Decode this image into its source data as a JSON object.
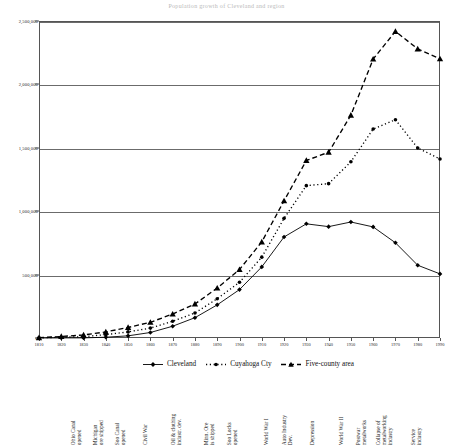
{
  "figure": {
    "title_sliver": "Population growth of Cleveland and region",
    "axis_color": "#555555",
    "grid_color": "#6b6b6b",
    "series_color": "#000000"
  },
  "chart_data": {
    "type": "line",
    "title": "Population growth of Cleveland and region",
    "xlabel": "",
    "ylabel": "",
    "xlim": [
      1810,
      1990
    ],
    "ylim": [
      0,
      2500000
    ],
    "grid": true,
    "legend_position": "bottom",
    "x": [
      1810,
      1820,
      1830,
      1840,
      1850,
      1860,
      1870,
      1880,
      1890,
      1900,
      1910,
      1920,
      1930,
      1940,
      1950,
      1960,
      1970,
      1980,
      1990
    ],
    "xticklabels": [
      "1810",
      "1820",
      "1830",
      "1840",
      "1850",
      "1860",
      "1870",
      "1880",
      "1890",
      "1900",
      "1910",
      "1920",
      "1930",
      "1940",
      "1950",
      "1960",
      "1970",
      "1980",
      "1990"
    ],
    "yticks": [
      0,
      500000,
      1000000,
      1500000,
      2000000,
      2500000
    ],
    "yticklabels": [
      "0",
      "500,000",
      "1,000,000",
      "1,500,000",
      "2,000,000",
      "2,500,000"
    ],
    "series": [
      {
        "name": "Cleveland",
        "marker": "diamond",
        "linestyle": "solid",
        "values": [
          57,
          606,
          1075,
          6071,
          17034,
          43417,
          92829,
          160146,
          261353,
          381768,
          560663,
          796841,
          900429,
          878336,
          914808,
          876050,
          750903,
          573822,
          505616
        ]
      },
      {
        "name": "Cuyahoga Cty",
        "marker": "circle",
        "linestyle": "dotted",
        "values": [
          1459,
          6328,
          10373,
          26506,
          48099,
          78033,
          132010,
          196943,
          309970,
          439120,
          637425,
          943495,
          1201455,
          1217250,
          1389532,
          1647895,
          1721300,
          1498400,
          1412140
        ]
      },
      {
        "name": "Five-county area",
        "marker": "triangle",
        "linestyle": "dashed",
        "values": [
          2500,
          12000,
          24000,
          48000,
          83000,
          124000,
          189000,
          268000,
          394000,
          540000,
          758000,
          1082000,
          1400000,
          1465000,
          1757000,
          2200000,
          2418000,
          2280000,
          2202000
        ]
      }
    ],
    "annotations": [
      {
        "year": 1830,
        "label_lines": [
          "Ohio Canal",
          "opened"
        ]
      },
      {
        "year": 1840,
        "label_lines": [
          "Michigan",
          "ore shipped"
        ]
      },
      {
        "year": 1850,
        "label_lines": [
          "Soo Canal",
          "opened"
        ]
      },
      {
        "year": 1860,
        "label_lines": [
          "Civil War"
        ]
      },
      {
        "year": 1875,
        "label_lines": [
          "Oil & clothing",
          "industr. dev."
        ]
      },
      {
        "year": 1890,
        "label_lines": [
          "Minn. Ore",
          "is shipped"
        ]
      },
      {
        "year": 1900,
        "label_lines": [
          "Soo Locks",
          "opened"
        ]
      },
      {
        "year": 1914,
        "label_lines": [
          "World War I"
        ]
      },
      {
        "year": 1925,
        "label_lines": [
          "Auto Industry",
          "Dev."
        ]
      },
      {
        "year": 1935,
        "label_lines": [
          "Depression"
        ]
      },
      {
        "year": 1948,
        "label_lines": [
          "World War II"
        ]
      },
      {
        "year": 1958,
        "label_lines": [
          "Postwar",
          "metalworks"
        ]
      },
      {
        "year": 1970,
        "label_lines": [
          "Collapse of",
          "metalworking",
          "industry"
        ]
      },
      {
        "year": 1983,
        "label_lines": [
          "Service",
          "industry"
        ]
      }
    ]
  },
  "legend": {
    "items": [
      {
        "label": "Cleveland",
        "marker": "diamond",
        "linestyle": "solid"
      },
      {
        "label": "Cuyahoga Cty",
        "marker": "circle",
        "linestyle": "dotted"
      },
      {
        "label": "Five-county area",
        "marker": "triangle",
        "linestyle": "dashed"
      }
    ]
  }
}
